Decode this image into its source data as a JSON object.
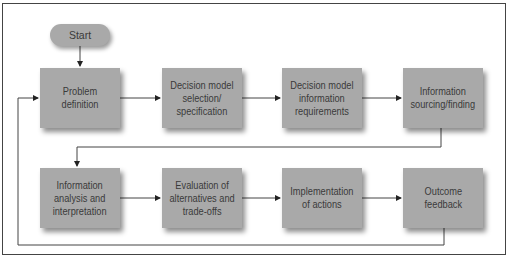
{
  "diagram": {
    "type": "flowchart",
    "start": {
      "label": "Start"
    },
    "rows": [
      {
        "boxes": [
          {
            "id": "problem-definition",
            "label": "Problem\ndefinition"
          },
          {
            "id": "decision-model-selection",
            "label": "Decision model\nselection/\nspecification"
          },
          {
            "id": "decision-model-information-requirements",
            "label": "Decision model\ninformation\nrequirements"
          },
          {
            "id": "information-sourcing",
            "label": "Information\nsourcing/finding"
          }
        ]
      },
      {
        "boxes": [
          {
            "id": "information-analysis",
            "label": "Information\nanalysis and\ninterpretation"
          },
          {
            "id": "evaluation-of-alternatives",
            "label": "Evaluation of\nalternatives and\ntrade-offs"
          },
          {
            "id": "implementation-of-actions",
            "label": "Implementation\nof actions"
          },
          {
            "id": "outcome-feedback",
            "label": "Outcome\nfeedback"
          }
        ]
      }
    ],
    "edges": [
      [
        "start",
        "problem-definition"
      ],
      [
        "problem-definition",
        "decision-model-selection"
      ],
      [
        "decision-model-selection",
        "decision-model-information-requirements"
      ],
      [
        "decision-model-information-requirements",
        "information-sourcing"
      ],
      [
        "information-sourcing",
        "information-analysis"
      ],
      [
        "information-analysis",
        "evaluation-of-alternatives"
      ],
      [
        "evaluation-of-alternatives",
        "implementation-of-actions"
      ],
      [
        "implementation-of-actions",
        "outcome-feedback"
      ],
      [
        "outcome-feedback",
        "problem-definition"
      ]
    ],
    "colors": {
      "box_fill": "#a9a9a9",
      "text": "#3a3a3a",
      "line": "#333333",
      "frame": "#444444"
    }
  }
}
